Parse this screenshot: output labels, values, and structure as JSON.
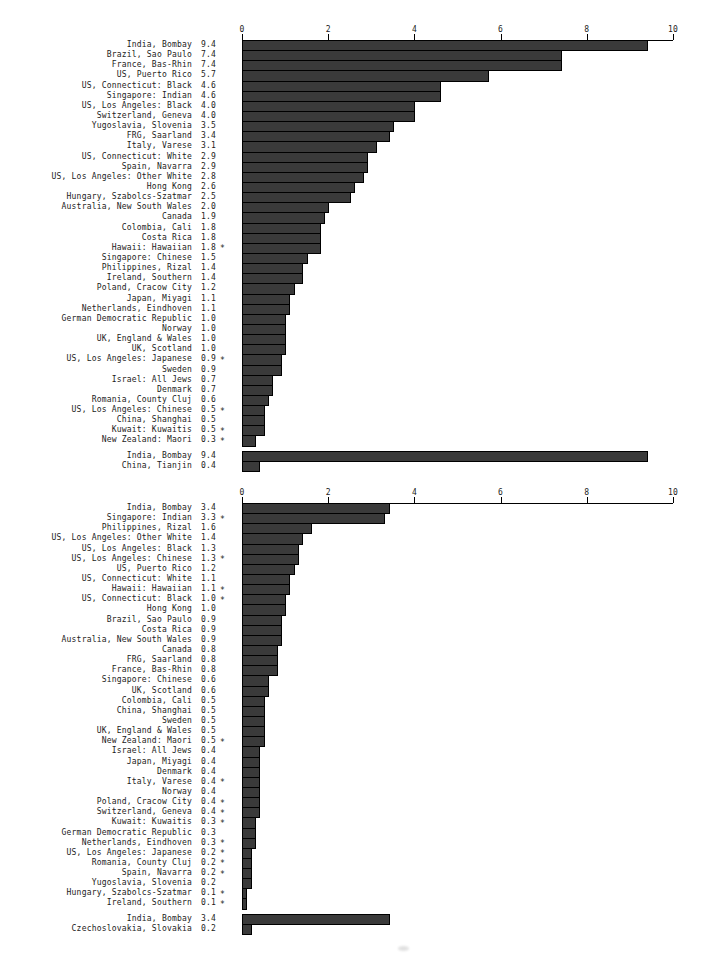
{
  "figure": {
    "background": "#ffffff",
    "text_color": "#1b1b1b",
    "bar_fill": "#3a3a3a",
    "bar_border": "#000000",
    "significance_marker": "*"
  },
  "chart_data": [
    {
      "type": "bar",
      "orientation": "horizontal",
      "title": "",
      "xlabel": "",
      "ylabel": "",
      "xlim": [
        0,
        10
      ],
      "x_ticks": [
        0,
        2,
        4,
        6,
        8,
        10
      ],
      "x_tick_labels": [
        "0",
        "2",
        "4",
        "6",
        "8",
        "10"
      ],
      "grid": false,
      "legend": null,
      "rows": [
        {
          "label": "India, Bombay",
          "value": 9.4,
          "star": false
        },
        {
          "label": "Brazil, Sao Paulo",
          "value": 7.4,
          "star": false
        },
        {
          "label": "France, Bas-Rhin",
          "value": 7.4,
          "star": false
        },
        {
          "label": "US, Puerto Rico",
          "value": 5.7,
          "star": false
        },
        {
          "label": "US, Connecticut: Black",
          "value": 4.6,
          "star": false
        },
        {
          "label": "Singapore: Indian",
          "value": 4.6,
          "star": false
        },
        {
          "label": "US, Los Angeles: Black",
          "value": 4.0,
          "star": false
        },
        {
          "label": "Switzerland, Geneva",
          "value": 4.0,
          "star": false
        },
        {
          "label": "Yugoslavia, Slovenia",
          "value": 3.5,
          "star": false
        },
        {
          "label": "FRG, Saarland",
          "value": 3.4,
          "star": false
        },
        {
          "label": "Italy, Varese",
          "value": 3.1,
          "star": false
        },
        {
          "label": "US, Connecticut: White",
          "value": 2.9,
          "star": false
        },
        {
          "label": "Spain, Navarra",
          "value": 2.9,
          "star": false
        },
        {
          "label": "US, Los Angeles: Other White",
          "value": 2.8,
          "star": false
        },
        {
          "label": "Hong Kong",
          "value": 2.6,
          "star": false
        },
        {
          "label": "Hungary, Szabolcs-Szatmar",
          "value": 2.5,
          "star": false
        },
        {
          "label": "Australia, New South Wales",
          "value": 2.0,
          "star": false
        },
        {
          "label": "Canada",
          "value": 1.9,
          "star": false
        },
        {
          "label": "Colombia, Cali",
          "value": 1.8,
          "star": false
        },
        {
          "label": "Costa Rica",
          "value": 1.8,
          "star": false
        },
        {
          "label": "Hawaii: Hawaiian",
          "value": 1.8,
          "star": true
        },
        {
          "label": "Singapore: Chinese",
          "value": 1.5,
          "star": false
        },
        {
          "label": "Philippines, Rizal",
          "value": 1.4,
          "star": false
        },
        {
          "label": "Ireland, Southern",
          "value": 1.4,
          "star": false
        },
        {
          "label": "Poland, Cracow City",
          "value": 1.2,
          "star": false
        },
        {
          "label": "Japan, Miyagi",
          "value": 1.1,
          "star": false
        },
        {
          "label": "Netherlands, Eindhoven",
          "value": 1.1,
          "star": false
        },
        {
          "label": "German Democratic Republic",
          "value": 1.0,
          "star": false
        },
        {
          "label": "Norway",
          "value": 1.0,
          "star": false
        },
        {
          "label": "UK, England & Wales",
          "value": 1.0,
          "star": false
        },
        {
          "label": "UK, Scotland",
          "value": 1.0,
          "star": false
        },
        {
          "label": "US, Los Angeles: Japanese",
          "value": 0.9,
          "star": true
        },
        {
          "label": "Sweden",
          "value": 0.9,
          "star": false
        },
        {
          "label": "Israel: All Jews",
          "value": 0.7,
          "star": false
        },
        {
          "label": "Denmark",
          "value": 0.7,
          "star": false
        },
        {
          "label": "Romania, County Cluj",
          "value": 0.6,
          "star": false
        },
        {
          "label": "US, Los Angeles: Chinese",
          "value": 0.5,
          "star": true
        },
        {
          "label": "China, Shanghai",
          "value": 0.5,
          "star": false
        },
        {
          "label": "Kuwait: Kuwaitis",
          "value": 0.5,
          "star": true
        },
        {
          "label": "New Zealand: Maori",
          "value": 0.3,
          "star": true
        }
      ],
      "separated_rows": [
        {
          "label": "India, Bombay",
          "value": 9.4,
          "star": false
        },
        {
          "label": "China, Tianjin",
          "value": 0.4,
          "star": false
        }
      ]
    },
    {
      "type": "bar",
      "orientation": "horizontal",
      "title": "",
      "xlabel": "",
      "ylabel": "",
      "xlim": [
        0,
        10
      ],
      "x_ticks": [
        0,
        2,
        4,
        6,
        8,
        10
      ],
      "x_tick_labels": [
        "0",
        "2",
        "4",
        "6",
        "8",
        "10"
      ],
      "grid": false,
      "legend": null,
      "rows": [
        {
          "label": "India, Bombay",
          "value": 3.4,
          "star": false
        },
        {
          "label": "Singapore: Indian",
          "value": 3.3,
          "star": true
        },
        {
          "label": "Philippines, Rizal",
          "value": 1.6,
          "star": false
        },
        {
          "label": "US, Los Angeles: Other White",
          "value": 1.4,
          "star": false
        },
        {
          "label": "US, Los Angeles: Black",
          "value": 1.3,
          "star": false
        },
        {
          "label": "US, Los Angeles: Chinese",
          "value": 1.3,
          "star": true
        },
        {
          "label": "US, Puerto Rico",
          "value": 1.2,
          "star": false
        },
        {
          "label": "US, Connecticut: White",
          "value": 1.1,
          "star": false
        },
        {
          "label": "Hawaii: Hawaiian",
          "value": 1.1,
          "star": true
        },
        {
          "label": "US, Connecticut: Black",
          "value": 1.0,
          "star": true
        },
        {
          "label": "Hong Kong",
          "value": 1.0,
          "star": false
        },
        {
          "label": "Brazil, Sao Paulo",
          "value": 0.9,
          "star": false
        },
        {
          "label": "Costa Rica",
          "value": 0.9,
          "star": false
        },
        {
          "label": "Australia, New South Wales",
          "value": 0.9,
          "star": false
        },
        {
          "label": "Canada",
          "value": 0.8,
          "star": false
        },
        {
          "label": "FRG, Saarland",
          "value": 0.8,
          "star": false
        },
        {
          "label": "France, Bas-Rhin",
          "value": 0.8,
          "star": false
        },
        {
          "label": "Singapore: Chinese",
          "value": 0.6,
          "star": false
        },
        {
          "label": "UK, Scotland",
          "value": 0.6,
          "star": false
        },
        {
          "label": "Colombia, Cali",
          "value": 0.5,
          "star": false
        },
        {
          "label": "China, Shanghai",
          "value": 0.5,
          "star": false
        },
        {
          "label": "Sweden",
          "value": 0.5,
          "star": false
        },
        {
          "label": "UK, England & Wales",
          "value": 0.5,
          "star": false
        },
        {
          "label": "New Zealand: Maori",
          "value": 0.5,
          "star": true
        },
        {
          "label": "Israel: All Jews",
          "value": 0.4,
          "star": false
        },
        {
          "label": "Japan, Miyagi",
          "value": 0.4,
          "star": false
        },
        {
          "label": "Denmark",
          "value": 0.4,
          "star": false
        },
        {
          "label": "Italy, Varese",
          "value": 0.4,
          "star": true
        },
        {
          "label": "Norway",
          "value": 0.4,
          "star": false
        },
        {
          "label": "Poland, Cracow City",
          "value": 0.4,
          "star": true
        },
        {
          "label": "Switzerland, Geneva",
          "value": 0.4,
          "star": true
        },
        {
          "label": "Kuwait: Kuwaitis",
          "value": 0.3,
          "star": true
        },
        {
          "label": "German Democratic Republic",
          "value": 0.3,
          "star": false
        },
        {
          "label": "Netherlands, Eindhoven",
          "value": 0.3,
          "star": true
        },
        {
          "label": "US, Los Angeles: Japanese",
          "value": 0.2,
          "star": true
        },
        {
          "label": "Romania, County Cluj",
          "value": 0.2,
          "star": true
        },
        {
          "label": "Spain, Navarra",
          "value": 0.2,
          "star": true
        },
        {
          "label": "Yugoslavia, Slovenia",
          "value": 0.2,
          "star": false
        },
        {
          "label": "Hungary, Szabolcs-Szatmar",
          "value": 0.1,
          "star": true
        },
        {
          "label": "Ireland, Southern",
          "value": 0.1,
          "star": true
        }
      ],
      "separated_rows": [
        {
          "label": "India, Bombay",
          "value": 3.4,
          "star": false
        },
        {
          "label": "Czechoslovakia, Slovakia",
          "value": 0.2,
          "star": false
        }
      ]
    }
  ]
}
